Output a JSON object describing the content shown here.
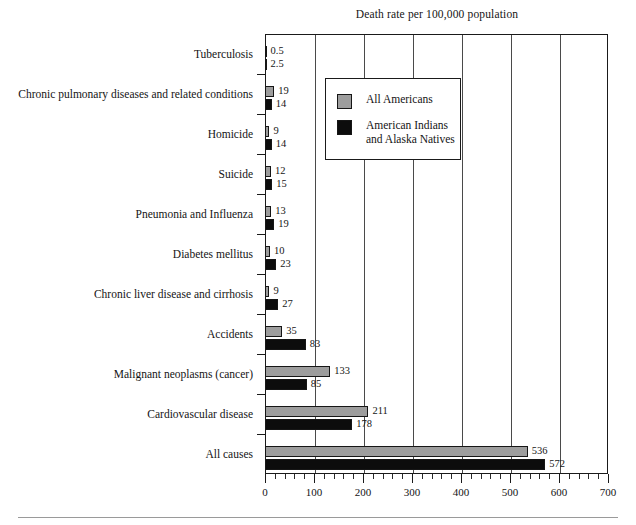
{
  "chart_data": {
    "type": "bar",
    "orientation": "horizontal",
    "title": "Death rate per 100,000 population",
    "xlabel": "",
    "ylabel": "",
    "xlim": [
      0,
      700
    ],
    "xticks": [
      0,
      100,
      200,
      300,
      400,
      500,
      600,
      700
    ],
    "xtick_labels": [
      "0",
      "100",
      "200",
      "300",
      "400",
      "500",
      "600",
      "700"
    ],
    "minor_tick_interval": 20,
    "grid": "vertical",
    "legend_position": "upper-left-inside",
    "categories": [
      "Tuberculosis",
      "Chronic pulmonary diseases and related conditions",
      "Homicide",
      "Suicide",
      "Pneumonia and Influenza",
      "Diabetes mellitus",
      "Chronic liver disease and cirrhosis",
      "Accidents",
      "Malignant neoplasms (cancer)",
      "Cardiovascular disease",
      "All causes"
    ],
    "series": [
      {
        "name": "All Americans",
        "color": "#9d9d9d",
        "values": [
          0.5,
          19,
          9,
          12,
          13,
          10,
          9,
          35,
          133,
          211,
          536
        ],
        "labels": [
          "0.5",
          "19",
          "9",
          "12",
          "13",
          "10",
          "9",
          "35",
          "133",
          "211",
          "536"
        ]
      },
      {
        "name": "American Indians and Alaska Natives",
        "color": "#0c0c0c",
        "values": [
          2.5,
          14,
          14,
          15,
          19,
          23,
          27,
          83,
          85,
          178,
          572
        ],
        "labels": [
          "2.5",
          "14",
          "14",
          "15",
          "19",
          "23",
          "27",
          "83",
          "85",
          "178",
          "572"
        ]
      }
    ]
  },
  "legend": {
    "entries": [
      {
        "label": "All Americans",
        "label_line2": "",
        "swatch": "all-americans"
      },
      {
        "label": "American Indians",
        "label_line2": "and Alaska Natives",
        "swatch": "natives"
      }
    ]
  }
}
